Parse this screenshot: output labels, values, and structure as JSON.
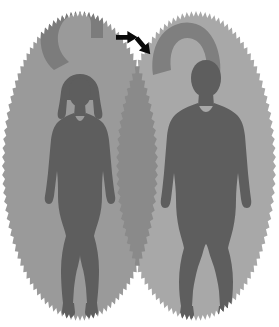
{
  "figure": {
    "caption": "Two overlapping oval-shaped panels, each containing a full-body human silhouette shown from the front; a curved horseshoe-shaped band arcs over each head, and two black arrows point toward the arcs.",
    "width": 279,
    "height": 327,
    "background_color": "#ffffff"
  },
  "colors": {
    "background": "#ffffff",
    "left_ellipse": "#9a9a9a",
    "right_ellipse": "#a8a8a8",
    "ellipse_overlap": "#8a8a8a",
    "left_arc": "#7c7c7c",
    "right_arc": "#7f7f7f",
    "figure_silhouette": "#5e5e5e",
    "arrow": "#0a0a0a",
    "scallop_edge": "#9a9a9a"
  },
  "panels": [
    {
      "id": "left-panel",
      "label": "Female panel",
      "shape": "scalloped-ellipse",
      "fill": "#9a9a9a",
      "center_x": 80,
      "center_y": 166,
      "radius_x": 78,
      "radius_y": 155,
      "scallop_teeth": 108,
      "figure": {
        "id": "female-figure",
        "label": "Female body silhouette",
        "sex": "female",
        "view": "anterior",
        "fill": "#5e5e5e",
        "hair": "shoulder-length",
        "center_x": 80,
        "head_top_y": 76,
        "feet_bottom_y": 312
      },
      "arc": {
        "id": "left-arc",
        "label": "Curved band over head",
        "orientation": "hook-opening-down-right",
        "fill": "#7c7c7c",
        "clipped_by_panel": true
      }
    },
    {
      "id": "right-panel",
      "label": "Male panel",
      "shape": "scalloped-ellipse",
      "fill": "#a8a8a8",
      "center_x": 196,
      "center_y": 166,
      "radius_x": 80,
      "radius_y": 155,
      "scallop_teeth": 108,
      "figure": {
        "id": "male-figure",
        "label": "Male body silhouette",
        "sex": "male",
        "view": "anterior",
        "fill": "#5e5e5e",
        "hair": "short",
        "center_x": 206,
        "head_top_y": 62,
        "feet_bottom_y": 308
      },
      "arc": {
        "id": "right-arc",
        "label": "Curved band over head",
        "orientation": "inverted-u-horseshoe",
        "fill": "#7f7f7f",
        "clipped_by_panel": true
      }
    }
  ],
  "annotations": {
    "arrows": [
      {
        "id": "arrow-left",
        "label": "Arrow pointing right",
        "direction": "right",
        "rotation_deg": 0,
        "x": 116,
        "y": 30,
        "length": 22,
        "fill": "#0a0a0a"
      },
      {
        "id": "arrow-right",
        "label": "Arrow pointing down-right",
        "direction": "down-right",
        "rotation_deg": 50,
        "x": 142,
        "y": 33,
        "length": 22,
        "fill": "#0a0a0a"
      }
    ]
  }
}
